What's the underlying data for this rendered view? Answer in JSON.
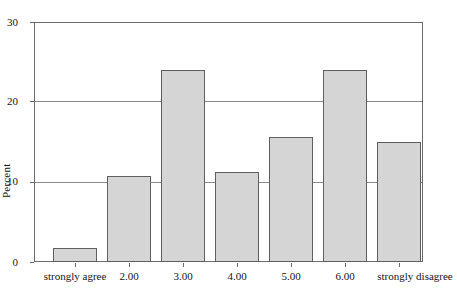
{
  "chart_data": {
    "type": "bar",
    "title": "",
    "subtitle": "",
    "xlabel": "",
    "ylabel": "Percent",
    "categories": [
      "strongly agree",
      "2.00",
      "3.00",
      "4.00",
      "5.00",
      "6.00",
      "strongly disagree"
    ],
    "values": [
      1.8,
      10.7,
      24.0,
      11.2,
      15.6,
      24.0,
      15.0
    ],
    "ylim": [
      0,
      30
    ],
    "y_ticks": [
      0,
      10,
      20,
      30
    ],
    "y_tick_labels": [
      "0",
      "10",
      "20",
      "30"
    ],
    "grid": true,
    "gridlines_at": [
      10,
      20,
      30
    ],
    "legend": null,
    "legend_position": "none",
    "annotations": [],
    "colors": {
      "bar_fill": "#d5d5d5",
      "bar_edge": "#5e5e5e",
      "axis": "#6b6b6b",
      "grid": "#8a8a8a",
      "text": "#141414",
      "background": "#ffffff"
    }
  }
}
